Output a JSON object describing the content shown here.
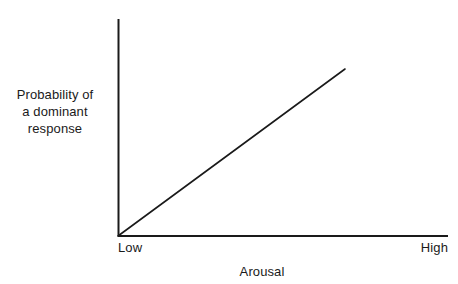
{
  "chart_data": {
    "type": "line",
    "title": "",
    "xlabel": "Arousal",
    "ylabel": "Probability of\na dominant\nresponse",
    "ylabel_lines": [
      "Probability of",
      "a dominant",
      "response"
    ],
    "xtick_labels": [
      "Low",
      "High"
    ],
    "ytick_labels": [],
    "grid": false,
    "legend": false,
    "xlim": [
      0,
      1
    ],
    "ylim": [
      0,
      1
    ],
    "axis_color": "#1a1a1a",
    "line_color": "#1a1a1a",
    "background_color": "#ffffff",
    "series": [
      {
        "name": "Probability of a dominant response",
        "x": [
          0,
          0.25,
          0.5,
          0.75,
          1.0
        ],
        "y": [
          0,
          0.1925,
          0.385,
          0.5775,
          0.77
        ],
        "description": "Straight line rising linearly from the origin"
      }
    ],
    "annotations": []
  },
  "axes_geometry": {
    "x_axis_start_px": 118,
    "x_axis_end_px": 448,
    "y_axis_top_px": 19,
    "origin_y_px": 236,
    "line_end_x_px": 345,
    "line_end_y_px": 69
  }
}
